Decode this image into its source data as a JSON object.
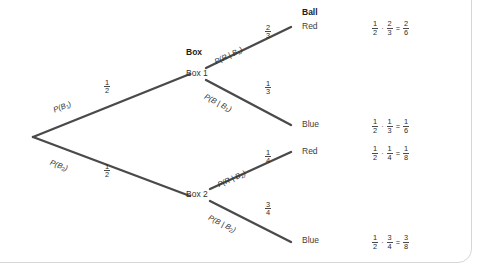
{
  "figure": {
    "type": "probability-tree-diagram",
    "column_headers": {
      "box": "Box",
      "ball": "Ball"
    },
    "root": {
      "label": ""
    },
    "stage1": [
      {
        "branch_label": "P(B",
        "branch_sub": "1",
        "branch_label_close": ")",
        "probability_numerator": "1",
        "probability_denominator": "2",
        "node_label": "Box 1"
      },
      {
        "branch_label": "P(B",
        "branch_sub": "2",
        "branch_label_close": ")",
        "probability_numerator": "1",
        "probability_denominator": "2",
        "node_label": "Box 2"
      }
    ],
    "stage2": [
      {
        "branch_label_pre": "P(R | B",
        "branch_sub": "1",
        "branch_label_close": ")",
        "probability_numerator": "2",
        "probability_denominator": "3",
        "outcome": "Red"
      },
      {
        "branch_label_pre": "P(B | B",
        "branch_sub": "1",
        "branch_label_close": ")",
        "probability_numerator": "1",
        "probability_denominator": "3",
        "outcome": "Blue"
      },
      {
        "branch_label_pre": "P(R | B",
        "branch_sub": "2",
        "branch_label_close": ")",
        "probability_numerator": "1",
        "probability_denominator": "4",
        "outcome": "Red"
      },
      {
        "branch_label_pre": "P(B | B",
        "branch_sub": "2",
        "branch_label_close": ")",
        "probability_numerator": "3",
        "probability_denominator": "4",
        "outcome": "Blue"
      }
    ],
    "equations": [
      {
        "a_num": "1",
        "a_den": "2",
        "mult": "·",
        "b_num": "2",
        "b_den": "3",
        "equals": "=",
        "r_num": "2",
        "r_den": "6"
      },
      {
        "a_num": "1",
        "a_den": "2",
        "mult": "·",
        "b_num": "1",
        "b_den": "3",
        "equals": "=",
        "r_num": "1",
        "r_den": "6"
      },
      {
        "a_num": "1",
        "a_den": "2",
        "mult": "·",
        "b_num": "1",
        "b_den": "4",
        "equals": "=",
        "r_num": "1",
        "r_den": "8"
      },
      {
        "a_num": "1",
        "a_den": "2",
        "mult": "·",
        "b_num": "3",
        "b_den": "4",
        "equals": "=",
        "r_num": "3",
        "r_den": "8"
      }
    ],
    "colors": {
      "branch_stroke": "#4a4a4a",
      "text": "#333333",
      "panel_border": "#d6d6d6",
      "background": "#ffffff"
    }
  }
}
